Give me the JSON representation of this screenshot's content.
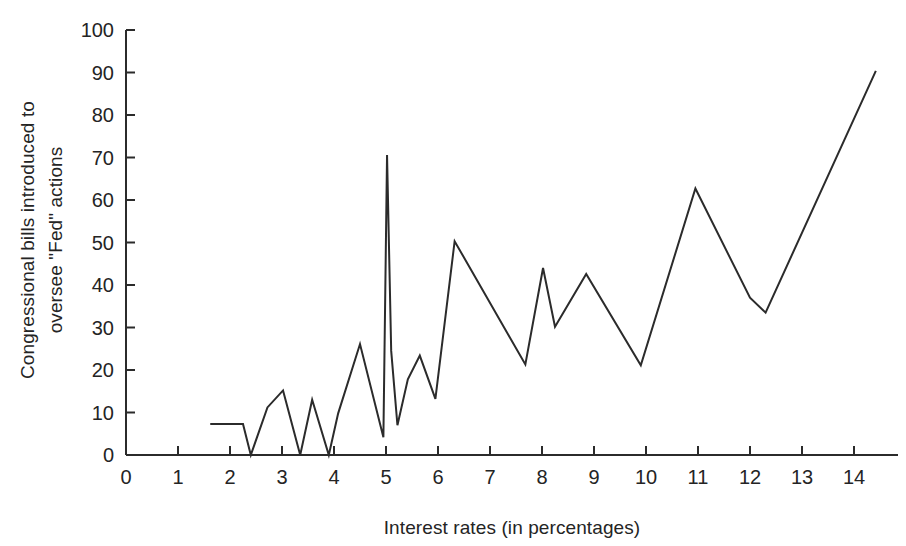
{
  "chart_data": {
    "type": "line",
    "title": "",
    "xlabel": "Interest rates (in percentages)",
    "ylabel": "Congressional bills introduced to oversee \"Fed\" actions",
    "ylabel_line1": "Congressional bills introduced to",
    "ylabel_line2": "oversee \"Fed\" actions",
    "xlim": [
      0,
      15
    ],
    "ylim": [
      0,
      100
    ],
    "xticks": [
      0,
      1,
      2,
      3,
      4,
      5,
      6,
      7,
      8,
      9,
      10,
      11,
      12,
      13,
      14
    ],
    "xtick_labels": [
      "0",
      "1",
      "2",
      "3",
      "4",
      "5",
      "6",
      "7",
      "8",
      "9",
      "10",
      "11",
      "12",
      "13",
      "14"
    ],
    "yticks": [
      0,
      10,
      20,
      30,
      40,
      50,
      60,
      70,
      80,
      90,
      100
    ],
    "ytick_labels": [
      "0",
      "10",
      "20",
      "30",
      "40",
      "50",
      "60",
      "70",
      "80",
      "90",
      "100"
    ],
    "grid": false,
    "legend": false,
    "line_color": "#2b2b2b",
    "series": [
      {
        "name": "Congressional bills",
        "x": [
          1.62,
          2.25,
          2.4,
          2.72,
          3.02,
          3.35,
          3.58,
          3.9,
          4.08,
          4.5,
          4.95,
          5.02,
          5.1,
          5.22,
          5.42,
          5.65,
          5.95,
          6.32,
          7.68,
          8.02,
          8.25,
          8.85,
          9.9,
          10.95,
          12.0,
          12.3,
          14.42
        ],
        "y": [
          7.3,
          7.3,
          0.0,
          11.2,
          15.2,
          0.0,
          13.0,
          0.0,
          9.8,
          26.1,
          4.2,
          70.6,
          24.5,
          7.0,
          17.8,
          23.4,
          13.2,
          50.3,
          21.3,
          44.0,
          30.2,
          42.6,
          21.1,
          62.7,
          37.0,
          33.5,
          90.4
        ]
      }
    ]
  }
}
